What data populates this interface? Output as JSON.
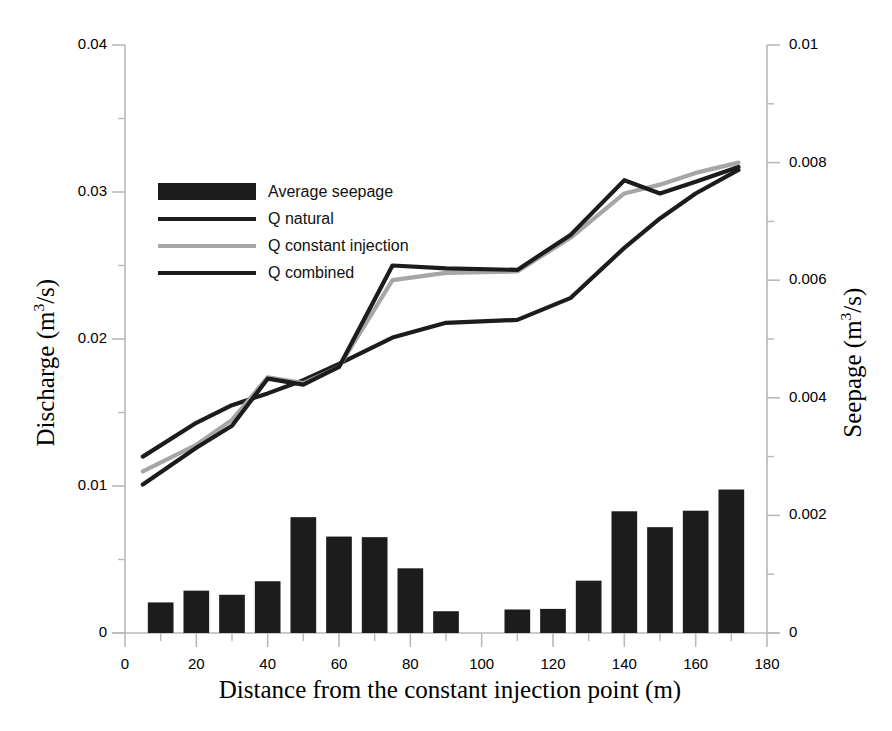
{
  "chart_data": {
    "type": "bar",
    "title": "",
    "xlabel": "Distance from the constant injection point (m)",
    "ylabel": "Discharge (m3/s)",
    "ylabel_left_prefix": "Discharge (m",
    "ylabel_left_sup": "3",
    "ylabel_left_suffix": "/s)",
    "ylabel_right_prefix": "Seepage (m",
    "ylabel_right_sup": "3",
    "ylabel_right_suffix": "/s)",
    "xlim": [
      0,
      180
    ],
    "ylim_left": [
      0,
      0.04
    ],
    "ylim_right": [
      0,
      0.01
    ],
    "grid": false,
    "legend_position": "upper-left-inside",
    "x_ticks": [
      0,
      20,
      40,
      60,
      80,
      100,
      120,
      140,
      160,
      180
    ],
    "x_tick_labels": [
      "0",
      "20",
      "40",
      "60",
      "80",
      "100",
      "120",
      "140",
      "160",
      "180"
    ],
    "x_minor_ticks": [
      10,
      30,
      50,
      70,
      90,
      110,
      130,
      150,
      170
    ],
    "y_left_ticks": [
      0,
      0.01,
      0.02,
      0.03,
      0.04
    ],
    "y_left_tick_labels": [
      "0",
      "0.01",
      "0.02",
      "0.03",
      "0.04"
    ],
    "y_left_minor_ticks": [
      0.005,
      0.015,
      0.025,
      0.035
    ],
    "y_right_ticks": [
      0,
      0.002,
      0.004,
      0.006,
      0.008,
      0.01
    ],
    "y_right_tick_labels": [
      "0",
      "0.002",
      "0.004",
      "0.006",
      "0.008",
      "0.01"
    ],
    "y_right_minor_ticks": [
      0.001,
      0.003,
      0.005,
      0.007,
      0.009
    ],
    "bar_color": "#1c1c1c",
    "bars": {
      "name": "Average seepage",
      "axis": "right",
      "x_centers": [
        10,
        20,
        30,
        40,
        50,
        60,
        70,
        80,
        90,
        110,
        120,
        130,
        140,
        150,
        160,
        170
      ],
      "values": [
        0.00052,
        0.00072,
        0.00065,
        0.00088,
        0.00197,
        0.00164,
        0.00163,
        0.0011,
        0.00037,
        0.0004,
        0.00041,
        0.00089,
        0.00207,
        0.0018,
        0.00208,
        0.00244
      ]
    },
    "series": [
      {
        "name": "Q natural",
        "axis": "left",
        "color": "#1c1c1c",
        "x": [
          5,
          20,
          30,
          40,
          50,
          60,
          75,
          90,
          110,
          125,
          140,
          150,
          160,
          172
        ],
        "y": [
          0.012,
          0.0143,
          0.0155,
          0.0163,
          0.0172,
          0.0183,
          0.0201,
          0.0211,
          0.0213,
          0.0228,
          0.0262,
          0.0282,
          0.0299,
          0.0315
        ]
      },
      {
        "name": "Q constant injection",
        "axis": "left",
        "color": "#a6a6a6",
        "x": [
          5,
          20,
          30,
          40,
          50,
          60,
          75,
          90,
          110,
          125,
          140,
          150,
          160,
          172
        ],
        "y": [
          0.011,
          0.0128,
          0.0145,
          0.0174,
          0.017,
          0.0181,
          0.024,
          0.0245,
          0.0246,
          0.0269,
          0.0299,
          0.0305,
          0.0313,
          0.032
        ]
      },
      {
        "name": "Q combined",
        "axis": "left",
        "color": "#1c1c1c",
        "x": [
          5,
          20,
          30,
          40,
          50,
          60,
          75,
          90,
          110,
          125,
          140,
          150,
          160,
          172
        ],
        "y": [
          0.0101,
          0.0126,
          0.0141,
          0.0173,
          0.0169,
          0.0181,
          0.025,
          0.0248,
          0.0247,
          0.0271,
          0.0308,
          0.0299,
          0.0307,
          0.0317
        ]
      }
    ],
    "legend": [
      {
        "label": "Average seepage",
        "marker": "bar",
        "color": "#1c1c1c"
      },
      {
        "label": "Q natural",
        "marker": "line",
        "color": "#1c1c1c"
      },
      {
        "label": "Q constant injection",
        "marker": "line",
        "color": "#a6a6a6"
      },
      {
        "label": "Q combined",
        "marker": "line",
        "color": "#1c1c1c"
      }
    ]
  }
}
